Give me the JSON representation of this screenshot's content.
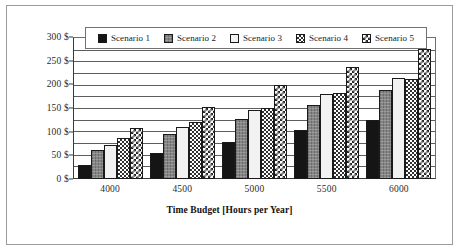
{
  "chart_data": {
    "type": "bar",
    "title": "",
    "xlabel": "Time Budget [Hours per Year]",
    "ylabel": "",
    "categories": [
      "4000",
      "4500",
      "5000",
      "5500",
      "6000"
    ],
    "ylim": [
      0,
      300
    ],
    "ytick_values": [
      0,
      50,
      100,
      150,
      200,
      250,
      300
    ],
    "ytick_labels": [
      "0 $",
      "50 $",
      "100 $",
      "150 $",
      "200 $",
      "250 $",
      "300 $"
    ],
    "gridline_step": 25,
    "grid": true,
    "legend_position": "top",
    "series": [
      {
        "name": "Scenario 1",
        "pattern": "solid-black",
        "color": "#151515",
        "values": [
          29,
          55,
          78,
          103,
          125
        ]
      },
      {
        "name": "Scenario 2",
        "pattern": "gray-fill",
        "color": "#858585",
        "values": [
          62,
          95,
          126,
          157,
          188
        ]
      },
      {
        "name": "Scenario 3",
        "pattern": "white-fill",
        "color": "#f2f2f2",
        "values": [
          72,
          110,
          145,
          180,
          213
        ]
      },
      {
        "name": "Scenario 4",
        "pattern": "checker-fine",
        "color": "#303030",
        "values": [
          87,
          120,
          151,
          182,
          211
        ]
      },
      {
        "name": "Scenario 5",
        "pattern": "checker-coarse",
        "color": "#262626",
        "values": [
          108,
          153,
          198,
          237,
          275
        ]
      }
    ]
  },
  "legend": {
    "items": [
      {
        "label": "Scenario 1"
      },
      {
        "label": "Scenario 2"
      },
      {
        "label": "Scenario 3"
      },
      {
        "label": "Scenario 4"
      },
      {
        "label": "Scenario 5"
      }
    ]
  }
}
